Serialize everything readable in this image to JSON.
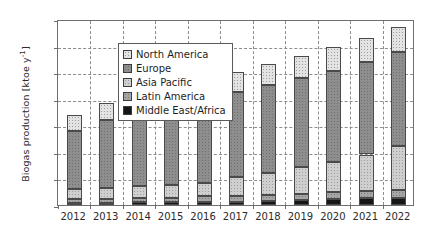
{
  "chart_data": {
    "type": "bar",
    "subtype": "stacked-bar",
    "title": "",
    "xlabel": "",
    "ylabel": "Biogas production [ktoe y-1]",
    "ylabel_parts": {
      "text": "Biogas production [ktoe y",
      "sup": "-1",
      "tail": "]"
    },
    "categories": [
      "2012",
      "2013",
      "2014",
      "2015",
      "2016",
      "2017",
      "2018",
      "2019",
      "2020",
      "2021",
      "2022"
    ],
    "ylim": [
      0,
      35
    ],
    "yticks": [
      0,
      5,
      10,
      15,
      20,
      25,
      30,
      35
    ],
    "grid": {
      "horizontal": true,
      "vertical": true,
      "style": "dashed"
    },
    "legend": {
      "position": "upper-left",
      "frame": true
    },
    "stack_order_bottom_to_top": [
      "Middle East/Africa",
      "Latin America",
      "Asia Pacific",
      "Europe",
      "North America"
    ],
    "series": [
      {
        "name": "North America",
        "color": "#e3e3e3",
        "values": [
          3.0,
          3.2,
          3.4,
          3.5,
          3.6,
          3.8,
          4.0,
          4.2,
          4.4,
          4.6,
          4.8
        ]
      },
      {
        "name": "Europe",
        "color": "#8e8e8e",
        "values": [
          11.0,
          12.8,
          14.6,
          14.2,
          14.8,
          16.0,
          16.4,
          16.8,
          17.2,
          17.4,
          17.6
        ]
      },
      {
        "name": "Asia Pacific",
        "color": "#cfcfcf",
        "values": [
          1.9,
          2.0,
          2.2,
          2.4,
          2.6,
          3.6,
          4.2,
          5.0,
          5.6,
          6.8,
          8.2
        ]
      },
      {
        "name": "Latin America",
        "color": "#a5a5a5",
        "values": [
          0.7,
          0.8,
          0.9,
          0.9,
          1.0,
          1.0,
          1.1,
          1.2,
          1.3,
          1.4,
          1.5
        ]
      },
      {
        "name": "Middle East/Africa",
        "color": "#161616",
        "values": [
          0.4,
          0.4,
          0.5,
          0.5,
          0.6,
          0.6,
          0.8,
          0.9,
          1.2,
          1.3,
          1.4
        ]
      }
    ],
    "totals": [
      17.0,
      19.2,
      21.6,
      21.5,
      22.6,
      25.0,
      26.5,
      28.1,
      29.7,
      31.5,
      33.5
    ]
  }
}
